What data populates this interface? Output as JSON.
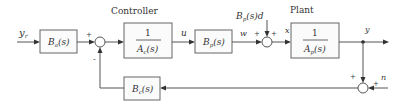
{
  "diagram": {
    "type": "block_diagram",
    "groups": {
      "controller": "Controller",
      "plant": "Plant"
    },
    "signals": {
      "reference": {
        "base": "y",
        "sub": "r"
      },
      "u": "u",
      "w": "w",
      "x": "x",
      "y": "y",
      "n": "n",
      "disturbance": {
        "base": "B",
        "sub": "p",
        "tail": "(s)d"
      }
    },
    "blocks": [
      {
        "id": "Ba",
        "base": "B",
        "sub": "a",
        "tail": "(s)"
      },
      {
        "id": "Ac",
        "num": "1",
        "base": "A",
        "sub": "c",
        "tail": "(s)"
      },
      {
        "id": "Bp",
        "base": "B",
        "sub": "p",
        "tail": "(s)"
      },
      {
        "id": "Ap",
        "num": "1",
        "base": "A",
        "sub": "p",
        "tail": "(s)"
      },
      {
        "id": "Bc",
        "base": "B",
        "sub": "c",
        "tail": "(s)"
      }
    ],
    "signs": {
      "sum1_top": "+",
      "sum1_bottom": "-",
      "sum2_left": "+",
      "sum2_top": "+",
      "sum3_top": "+",
      "sum3_right": "+"
    },
    "connections": [
      "y_r -> Ba",
      "Ba -> sum1 (+)",
      "Bc -> sum1 (-)",
      "sum1 -> 1/Ac",
      "1/Ac -> Bp (u)",
      "Bp -> sum2 (w, +)",
      "Bp(s)d -> sum2 (+)",
      "sum2 -> 1/Ap (x)",
      "1/Ap -> y (output)",
      "y -> sum3 (+)",
      "n -> sum3 (+)",
      "sum3 -> Bc"
    ]
  }
}
